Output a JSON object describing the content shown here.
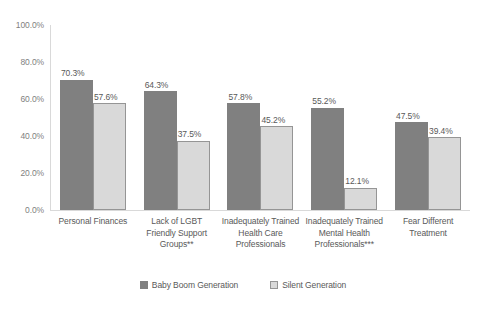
{
  "chart_data": {
    "type": "bar",
    "title": "",
    "subtitle": "",
    "xlabel": "",
    "ylabel": "",
    "ylim": [
      0,
      100
    ],
    "ytick_labels": [
      "100.0%",
      "80.0%",
      "60.0%",
      "40.0%",
      "20.0%",
      "0.0%"
    ],
    "ytick_values": [
      100,
      80,
      60,
      40,
      20,
      0
    ],
    "grid": false,
    "legend_position": "bottom",
    "value_suffix": "%",
    "categories": [
      "Personal Finances",
      "Lack of LGBT Friendly Support Groups**",
      "Inadequately Trained Health Care Professionals",
      "Inadequately Trained Mental Health Professionals***",
      "Fear Different Treatment"
    ],
    "series": [
      {
        "name": "Baby Boom Generation",
        "color": "#808080",
        "values": [
          70.3,
          64.3,
          57.8,
          55.2,
          47.5
        ],
        "labels": [
          "70.3%",
          "64.3%",
          "57.8%",
          "55.2%",
          "47.5%"
        ]
      },
      {
        "name": "Silent Generation",
        "color": "#d9d9d9",
        "border_color": "#959595",
        "values": [
          57.6,
          37.5,
          45.2,
          12.1,
          39.4
        ],
        "labels": [
          "57.6%",
          "37.5%",
          "45.2%",
          "12.1%",
          "39.4%"
        ]
      }
    ]
  },
  "axis": {
    "line_color": "#d9d9d9"
  }
}
